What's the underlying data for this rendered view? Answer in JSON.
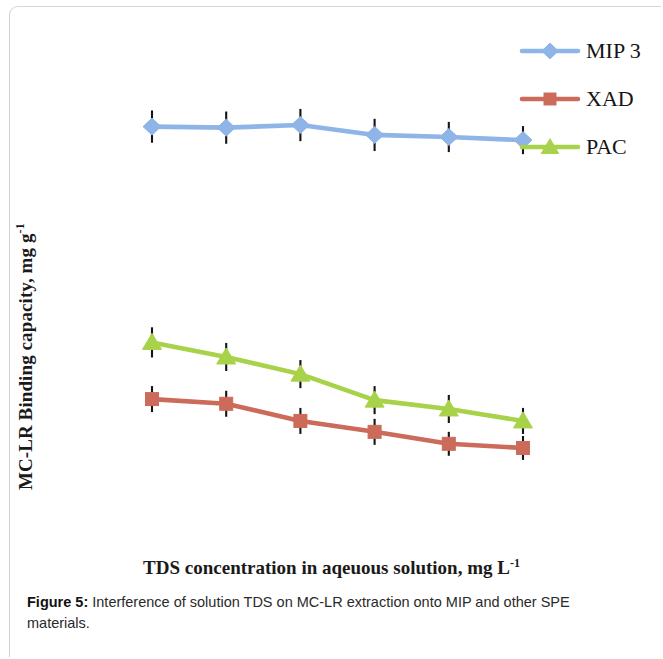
{
  "figure": {
    "caption_label": "Figure 5:",
    "caption_text": " Interference of solution TDS on MC-LR extraction onto MIP and other SPE materials."
  },
  "axes": {
    "ylabel_main": "MC-LR Binding capacity, mg g",
    "ylabel_sup": "-1",
    "xlabel_main": "TDS concentration in aqeuous solution, mg L",
    "xlabel_sup": "-1"
  },
  "legend": {
    "position": "top-right",
    "items": [
      {
        "label": "MIP 3",
        "color": "#8FB4E8",
        "marker": "diamond",
        "icon": "legend-marker-diamond-icon"
      },
      {
        "label": "XAD",
        "color": "#CC6B5A",
        "marker": "square",
        "icon": "legend-marker-square-icon"
      },
      {
        "label": "PAC",
        "color": "#A8D24A",
        "marker": "triangle",
        "icon": "legend-marker-triangle-icon"
      }
    ]
  },
  "chart_data": {
    "type": "line",
    "title": "",
    "subtitle": "",
    "xlabel": "TDS concentration in aqeuous solution, mg L-1",
    "ylabel": "MC-LR Binding capacity, mg g-1",
    "grid": false,
    "legend_position": "top-right",
    "axis_tick_labels_shown": false,
    "x": [
      1,
      2,
      3,
      4,
      5,
      6
    ],
    "xlim": [
      0.6,
      6.4
    ],
    "ylim": [
      0,
      1
    ],
    "note": "Axes carry no numeric tick labels in the source figure; y values are normalized 0-1 fractions of the plot height (1 = top of plot area).",
    "series": [
      {
        "name": "MIP 3",
        "color": "#8FB4E8",
        "marker": "diamond",
        "values": [
          0.795,
          0.793,
          0.798,
          0.779,
          0.775,
          0.769
        ],
        "errors": [
          0.031,
          0.031,
          0.031,
          0.031,
          0.029,
          0.027
        ]
      },
      {
        "name": "PAC",
        "color": "#A8D24A",
        "marker": "triangle",
        "values": [
          0.38,
          0.352,
          0.319,
          0.269,
          0.252,
          0.229
        ],
        "errors": [
          0.029,
          0.027,
          0.027,
          0.027,
          0.027,
          0.025
        ]
      },
      {
        "name": "XAD",
        "color": "#CC6B5A",
        "marker": "square",
        "values": [
          0.271,
          0.262,
          0.229,
          0.208,
          0.185,
          0.177
        ],
        "errors": [
          0.025,
          0.025,
          0.025,
          0.025,
          0.023,
          0.023
        ]
      }
    ]
  }
}
